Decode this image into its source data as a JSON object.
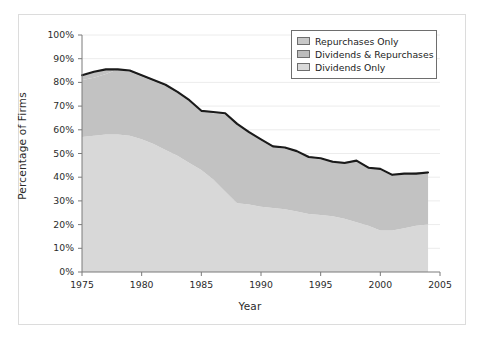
{
  "chart_data": {
    "type": "area",
    "stacked": true,
    "title": "",
    "xlabel": "Year",
    "ylabel": "Percentage of Firms",
    "xlim": [
      1975,
      2005
    ],
    "ylim": [
      0,
      100
    ],
    "xticks": [
      1975,
      1980,
      1985,
      1990,
      1995,
      2000,
      2005
    ],
    "xtick_labels": [
      "1975",
      "1980",
      "1985",
      "1990",
      "1995",
      "2000",
      "2005"
    ],
    "yticks": [
      0,
      10,
      20,
      30,
      40,
      50,
      60,
      70,
      80,
      90,
      100
    ],
    "ytick_labels": [
      "0%",
      "10%",
      "20%",
      "30%",
      "40%",
      "50%",
      "60%",
      "70%",
      "80%",
      "90%",
      "100%"
    ],
    "grid": "horizontal",
    "legend_position": "top-right",
    "x": [
      1975,
      1976,
      1977,
      1978,
      1979,
      1980,
      1981,
      1982,
      1983,
      1984,
      1985,
      1986,
      1987,
      1988,
      1989,
      1990,
      1991,
      1992,
      1993,
      1994,
      1995,
      1996,
      1997,
      1998,
      1999,
      2000,
      2001,
      2002,
      2003,
      2004
    ],
    "series": [
      {
        "name": "Dividends Only",
        "color": "#d8d8d8",
        "values": [
          57,
          57.5,
          58,
          58,
          57.5,
          56,
          54,
          51.5,
          49,
          46,
          43,
          39,
          34,
          29,
          28.5,
          27.5,
          27,
          26.5,
          25.5,
          24.5,
          24,
          23.5,
          22.5,
          21,
          19.5,
          17.5,
          17.5,
          18.5,
          19.5,
          20
        ]
      },
      {
        "name": "Dividends & Repurchases",
        "color": "#c2c2c2",
        "values": [
          24,
          24.5,
          25.5,
          27.5,
          27,
          26.5,
          26.5,
          27,
          26.5,
          26,
          24.5,
          28,
          32.5,
          33,
          30.5,
          28,
          25.5,
          25.5,
          25,
          24,
          23.5,
          23,
          23.5,
          25.5,
          24.5,
          25.5,
          23.5,
          22.5,
          22,
          22
        ]
      },
      {
        "name": "Repurchases Only",
        "color": "#c2c2c2",
        "values": [
          2,
          2.5,
          2,
          0,
          0.5,
          0.5,
          0.5,
          0.5,
          0.5,
          0.5,
          0.5,
          0.5,
          0.5,
          0.5,
          0.5,
          0.5,
          0.5,
          0.5,
          0.5,
          0.5,
          0.5,
          0.5,
          0.5,
          0.5,
          0.5,
          0.5,
          0.5,
          0.5,
          0.5,
          0.5
        ]
      }
    ],
    "total_line": {
      "name": "Total payers",
      "color": "#1a1a1a",
      "values": [
        83,
        84.5,
        85.5,
        85.5,
        85,
        83,
        81,
        79,
        76,
        72.5,
        68,
        67.5,
        67,
        62.5,
        59,
        56,
        53,
        52.5,
        51,
        48.5,
        48,
        46.5,
        46,
        47,
        44,
        43.5,
        41,
        41.5,
        41.5,
        42
      ]
    }
  },
  "legend": {
    "items": [
      {
        "label": "Repurchases Only",
        "color": "#c8c8c8"
      },
      {
        "label": "Dividends & Repurchases",
        "color": "#bcbcbc"
      },
      {
        "label": "Dividends Only",
        "color": "#d9d9d9"
      }
    ]
  },
  "axes": {
    "x_title": "Year",
    "y_title": "Percentage of Firms"
  }
}
